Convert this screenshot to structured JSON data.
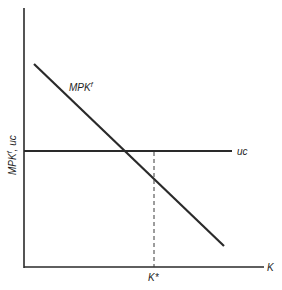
{
  "diagram": {
    "type": "economics-supply-demand-style",
    "axes": {
      "x_label": "K",
      "y_label": "MPK",
      "y_label_superscript": "f",
      "y_label_suffix": ", uc"
    },
    "curves": [
      {
        "name": "MPK",
        "superscript": "f",
        "label": "MPK",
        "slope": "downward"
      },
      {
        "name": "uc",
        "label": "uc",
        "slope": "horizontal"
      }
    ],
    "equilibrium": {
      "marker_label": "K*",
      "dashed_line": true
    },
    "colors": {
      "line": "#2a2a2a",
      "background": "#ffffff"
    }
  }
}
